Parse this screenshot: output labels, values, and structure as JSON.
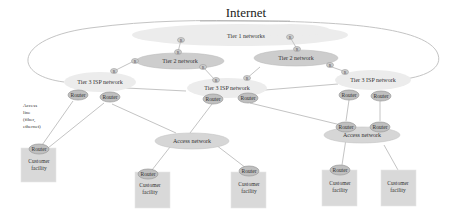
{
  "diagram": {
    "title": "Internet",
    "tier1": {
      "label": "Tier 1 networks"
    },
    "tier2": [
      {
        "label": "Tier 2 network"
      },
      {
        "label": "Tier 2 network"
      }
    ],
    "tier3": [
      {
        "label": "Tier 3 ISP network"
      },
      {
        "label": "Tier 3 ISP network"
      },
      {
        "label": "Tier 3 ISP network"
      }
    ],
    "access_networks": [
      {
        "label": "Access network"
      },
      {
        "label": "Access network"
      }
    ],
    "router_label": "Router",
    "small_router_label": "R",
    "facility": {
      "line1": "Customer",
      "line2": "facility"
    },
    "access_line": {
      "lines": [
        "Access",
        "line",
        "(fiber,",
        "ethernet)"
      ]
    },
    "colors": {
      "background": "#ffffff",
      "cloud": "#ececec",
      "tier2_fill": "#cdcdcd",
      "router_fill": "#bfbfbf",
      "facility_fill": "#d9d9d9",
      "link": "#c4c4c4"
    }
  }
}
